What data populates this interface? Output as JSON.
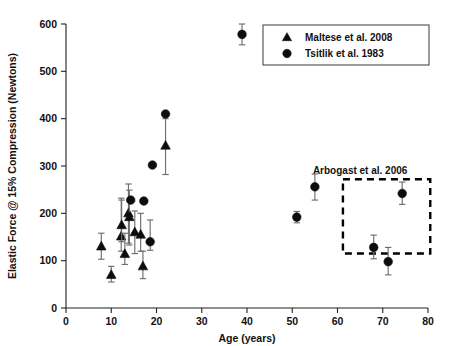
{
  "chart_data": {
    "type": "scatter",
    "title": "",
    "xlabel": "Age (years)",
    "ylabel": "Elastic Force @ 15% Compression (Newtons)",
    "xlim": [
      0,
      80
    ],
    "ylim": [
      0,
      600
    ],
    "xticks": [
      "0",
      "10",
      "20",
      "30",
      "40",
      "50",
      "60",
      "70",
      "80"
    ],
    "yticks": [
      "0",
      "100",
      "200",
      "300",
      "400",
      "500",
      "600"
    ],
    "grid": false,
    "legend_position": "top-right",
    "series": [
      {
        "name": "Maltese et al. 2008",
        "marker": "triangle",
        "color": "#0d0d0d",
        "points": [
          {
            "x": 7.8,
            "y": 130,
            "yerr_low": 103,
            "yerr_high": 158
          },
          {
            "x": 10.0,
            "y": 70,
            "yerr_low": 55,
            "yerr_high": 88
          },
          {
            "x": 12.2,
            "y": 151,
            "yerr_low": 120,
            "yerr_high": 232
          },
          {
            "x": 12.3,
            "y": 175,
            "yerr_low": 140,
            "yerr_high": 228
          },
          {
            "x": 13.0,
            "y": 114,
            "yerr_low": 92,
            "yerr_high": 158
          },
          {
            "x": 13.8,
            "y": 200,
            "yerr_low": 137,
            "yerr_high": 262
          },
          {
            "x": 14.0,
            "y": 192,
            "yerr_low": 133,
            "yerr_high": 249
          },
          {
            "x": 15.2,
            "y": 160,
            "yerr_low": 115,
            "yerr_high": 205
          },
          {
            "x": 16.5,
            "y": 155,
            "yerr_low": 120,
            "yerr_high": 200
          },
          {
            "x": 17.0,
            "y": 88,
            "yerr_low": 62,
            "yerr_high": 120
          },
          {
            "x": 22.0,
            "y": 343,
            "yerr_low": 282,
            "yerr_high": 400
          }
        ]
      },
      {
        "name": "Tsitlik et al. 1983",
        "marker": "circle",
        "color": "#0d0d0d",
        "points": [
          {
            "x": 14.3,
            "y": 228,
            "yerr_low": 228,
            "yerr_high": 228
          },
          {
            "x": 17.2,
            "y": 226,
            "yerr_low": 226,
            "yerr_high": 226
          },
          {
            "x": 18.6,
            "y": 140,
            "yerr_low": 122,
            "yerr_high": 186
          },
          {
            "x": 19.1,
            "y": 302,
            "yerr_low": 302,
            "yerr_high": 302
          },
          {
            "x": 22.0,
            "y": 410,
            "yerr_low": 410,
            "yerr_high": 410
          },
          {
            "x": 38.9,
            "y": 578,
            "yerr_low": 556,
            "yerr_high": 600
          },
          {
            "x": 51.0,
            "y": 192,
            "yerr_low": 180,
            "yerr_high": 204
          },
          {
            "x": 55.0,
            "y": 256,
            "yerr_low": 228,
            "yerr_high": 283
          },
          {
            "x": 68.0,
            "y": 128,
            "yerr_low": 104,
            "yerr_high": 154
          },
          {
            "x": 71.2,
            "y": 98,
            "yerr_low": 70,
            "yerr_high": 128
          },
          {
            "x": 74.3,
            "y": 242,
            "yerr_low": 219,
            "yerr_high": 266
          }
        ]
      }
    ],
    "annotations": [
      {
        "label": "Arbogast et al. 2006",
        "type": "dashed-rect",
        "x0": 61.2,
        "x1": 80.5,
        "y0": 115,
        "y1": 272,
        "label_x": 65.0,
        "label_y": 292
      }
    ]
  },
  "legend": {
    "entries": [
      {
        "marker": "triangle",
        "label": "Maltese et al. 2008"
      },
      {
        "marker": "circle",
        "label": "Tsitlik et al. 1983"
      }
    ]
  }
}
